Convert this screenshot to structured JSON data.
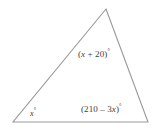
{
  "figure": {
    "type": "triangle-angle-diagram",
    "background_color": "#ffffff",
    "stroke_color": "#999999",
    "text_color": "#3d3d3d",
    "vertices": {
      "apex": {
        "x": 106,
        "y": 9
      },
      "bottom_left": {
        "x": 13,
        "y": 122
      },
      "bottom_right": {
        "x": 148,
        "y": 122
      }
    },
    "labels": {
      "apex": {
        "full_text": "(x + 20)°",
        "open_paren": "(",
        "variable": "x",
        "operator": " + ",
        "constant": "20",
        "close_paren": ")",
        "degree": "°"
      },
      "bottom_left": {
        "full_text": "x°",
        "variable": "x",
        "degree": "°"
      },
      "bottom_right": {
        "full_text": "(210 – 3x)°",
        "open_paren": "(",
        "constant": "210",
        "operator": " – ",
        "coefficient_term": "3",
        "variable": "x",
        "close_paren": ")",
        "degree": "°"
      }
    }
  }
}
